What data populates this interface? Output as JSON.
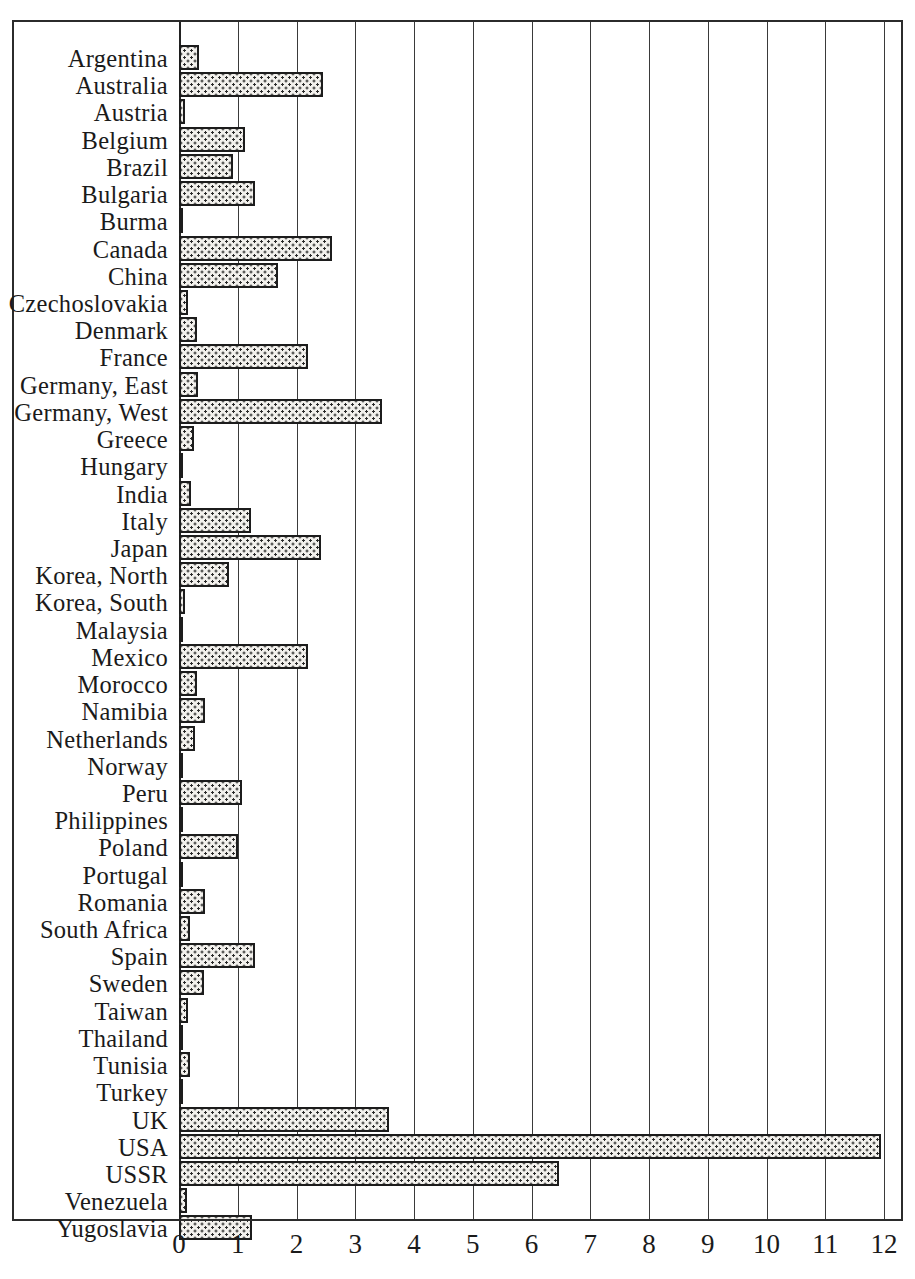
{
  "chart_data": {
    "type": "bar",
    "orientation": "horizontal",
    "title": "",
    "subtitle": "",
    "xlabel": "",
    "ylabel": "",
    "xlim": [
      0,
      12
    ],
    "ylim": null,
    "grid": true,
    "legend": null,
    "xticks": [
      "0",
      "1",
      "2",
      "3",
      "4",
      "5",
      "6",
      "7",
      "8",
      "9",
      "10",
      "11",
      "12"
    ],
    "xtick_values": [
      0,
      1,
      2,
      3,
      4,
      5,
      6,
      7,
      8,
      9,
      10,
      11,
      12
    ],
    "categories": [
      "Argentina",
      "Australia",
      "Austria",
      "Belgium",
      "Brazil",
      "Bulgaria",
      "Burma",
      "Canada",
      "China",
      "Czechoslovakia",
      "Denmark",
      "France",
      "Germany, East",
      "Germany, West",
      "Greece",
      "Hungary",
      "India",
      "Italy",
      "Japan",
      "Korea, North",
      "Korea, South",
      "Malaysia",
      "Mexico",
      "Morocco",
      "Namibia",
      "Netherlands",
      "Norway",
      "Peru",
      "Philippines",
      "Poland",
      "Portugal",
      "Romania",
      "South Africa",
      "Spain",
      "Sweden",
      "Taiwan",
      "Thailand",
      "Tunisia",
      "Turkey",
      "UK",
      "USA",
      "USSR",
      "Venezuela",
      "Yugoslavia"
    ],
    "values": [
      0.34,
      2.45,
      0.1,
      1.12,
      0.92,
      1.3,
      0.0,
      2.6,
      1.68,
      0.16,
      0.3,
      2.2,
      0.33,
      3.45,
      0.25,
      0.0,
      0.2,
      1.22,
      2.42,
      0.85,
      0.1,
      0.0,
      2.2,
      0.3,
      0.45,
      0.28,
      0.0,
      1.07,
      0.07,
      1.0,
      0.0,
      0.45,
      0.18,
      1.3,
      0.42,
      0.15,
      0.0,
      0.18,
      0.02,
      3.58,
      11.95,
      6.47,
      0.14,
      1.25
    ],
    "series": [
      {
        "name": "value",
        "values": [
          0.34,
          2.45,
          0.1,
          1.12,
          0.92,
          1.3,
          0.0,
          2.6,
          1.68,
          0.16,
          0.3,
          2.2,
          0.33,
          3.45,
          0.25,
          0.0,
          0.2,
          1.22,
          2.42,
          0.85,
          0.1,
          0.0,
          2.2,
          0.3,
          0.45,
          0.28,
          0.0,
          1.07,
          0.07,
          1.0,
          0.0,
          0.45,
          0.18,
          1.3,
          0.42,
          0.15,
          0.0,
          0.18,
          0.02,
          3.58,
          11.95,
          6.47,
          0.14,
          1.25
        ]
      }
    ],
    "bar_style": {
      "fill": "#f2f0ec",
      "pattern": "dotted-stipple",
      "edge": "#1c1c1c"
    },
    "axis_color": "#2b2b2b"
  }
}
